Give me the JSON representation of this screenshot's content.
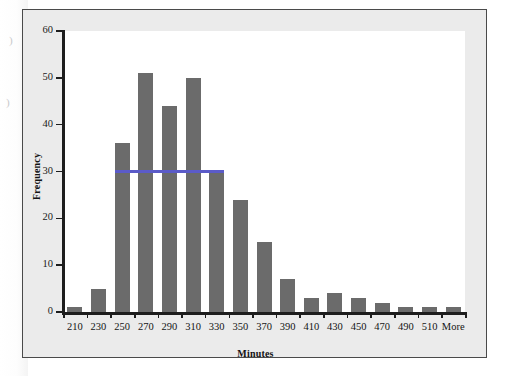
{
  "chart_data": {
    "type": "bar",
    "title": "",
    "xlabel": "Minutes",
    "ylabel": "Frequency",
    "categories": [
      "210",
      "230",
      "250",
      "270",
      "290",
      "310",
      "330",
      "350",
      "370",
      "390",
      "410",
      "430",
      "450",
      "470",
      "490",
      "510",
      "More"
    ],
    "values": [
      1,
      5,
      36,
      51,
      44,
      50,
      30,
      24,
      15,
      7,
      3,
      4,
      3,
      2,
      1,
      1,
      1
    ],
    "ylim": [
      0,
      60
    ],
    "y_ticks": [
      0,
      10,
      20,
      30,
      40,
      50,
      60
    ],
    "y_tick_labels": [
      "0",
      "10",
      "20",
      "30",
      "40",
      "50",
      "60"
    ],
    "grid": false,
    "legend": null,
    "series": [
      {
        "name": "Frequency",
        "values": [
          1,
          5,
          36,
          51,
          44,
          50,
          30,
          24,
          15,
          7,
          3,
          4,
          3,
          2,
          1,
          1,
          1
        ]
      }
    ],
    "annotations": [
      {
        "type": "horizontal-reference-line",
        "value": 30,
        "label": "",
        "color": "#5b5bc8",
        "spans_categories": [
          "250",
          "270",
          "290",
          "310",
          "330"
        ]
      }
    ],
    "colors": {
      "bar": "#6b6b6b",
      "reference_line": "#5b5bc8",
      "axis": "#1d1d1d",
      "plot_background": "#ffffff",
      "figure_background": "#ebebeb",
      "frame_border": "#4a4a4a",
      "text": "#141414"
    }
  },
  "page_artifacts": {
    "marks": [
      ")",
      ")"
    ]
  }
}
